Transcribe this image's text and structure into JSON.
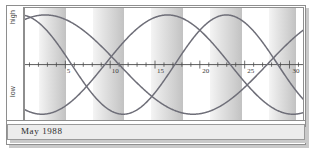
{
  "caption": {
    "text": "May 1988"
  },
  "axis_labels": {
    "high": "high",
    "low": "low"
  },
  "chart_data": {
    "type": "line",
    "title": "May 1988",
    "subtitle": "",
    "xlabel": "",
    "ylabel": "",
    "xlim": [
      0.5,
      31.5
    ],
    "ylim": [
      -1,
      1
    ],
    "grid": false,
    "legend": "none",
    "axis_line_value": 0,
    "y_axis_ticks": [
      {
        "label": "high",
        "value": 1
      },
      {
        "label": "low",
        "value": -1
      }
    ],
    "x_tick_labels": [
      "5",
      "10",
      "15",
      "20",
      "25",
      "30"
    ],
    "x_tick_values": [
      5,
      10,
      15,
      20,
      25,
      30
    ],
    "x_minor_ticks_every": 1,
    "shaded_bands": [
      {
        "start": 2.0,
        "end": 5.0
      },
      {
        "start": 8.0,
        "end": 11.5
      },
      {
        "start": 14.5,
        "end": 18.0
      },
      {
        "start": 21.0,
        "end": 24.5
      },
      {
        "start": 27.5,
        "end": 30.5
      }
    ],
    "series": [
      {
        "name": "physical",
        "period": 23,
        "phase_days": 17.2,
        "amplitude": 1,
        "color": "#6e6e78"
      },
      {
        "name": "emotional",
        "period": 28,
        "phase_days": 9.4,
        "amplitude": 1,
        "color": "#6e6e78"
      },
      {
        "name": "intellectual",
        "period": 33,
        "phase_days": 27.5,
        "amplitude": 1,
        "color": "#6e6e78"
      }
    ]
  },
  "colors": {
    "curve": "#6e6e78",
    "band_light": "#f4f4f4",
    "band_dark": "#c2c2c2",
    "frame": "#8e8e8e",
    "caption_bg": "#ececec",
    "shadow": "#c9c9c9"
  }
}
